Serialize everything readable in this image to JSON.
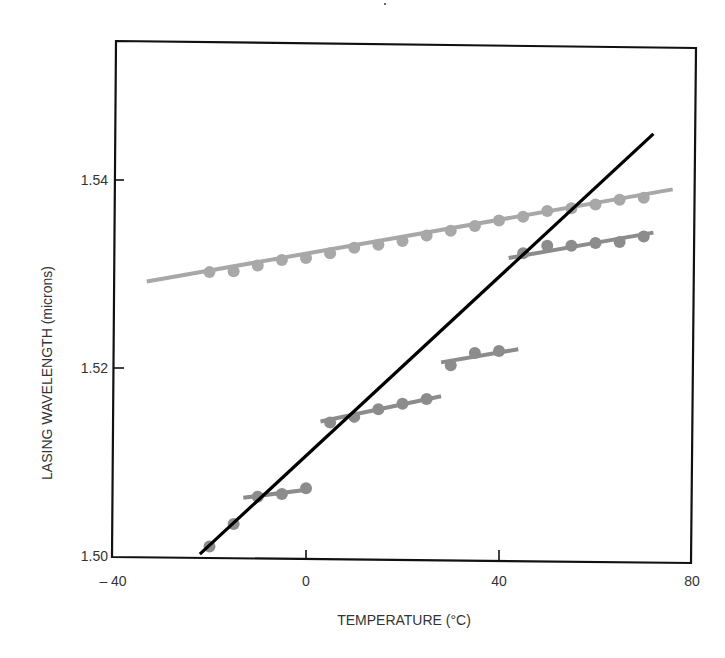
{
  "chart_data": {
    "type": "line",
    "title": "",
    "xlabel": "TEMPERATURE (°C)",
    "ylabel": "LASING WAVELENGTH (microns)",
    "xlim": [
      -40,
      80
    ],
    "ylim": [
      1.5,
      1.556
    ],
    "x_ticks": [
      -40,
      0,
      40,
      80
    ],
    "x_tick_labels": [
      "– 40",
      "0",
      "40",
      "80"
    ],
    "y_ticks": [
      1.5,
      1.52,
      1.54
    ],
    "y_tick_labels": [
      "1.50",
      "1.52",
      "1.54"
    ],
    "grid": false,
    "legend": null,
    "series": [
      {
        "name": "upper-tuning-line",
        "style": "light-gray line with markers",
        "color": "#a8a8a8",
        "fit_line": {
          "x": [
            -33,
            76
          ],
          "y": [
            1.5292,
            1.539
          ]
        },
        "points": {
          "x": [
            -20,
            -15,
            -10,
            -5,
            0,
            5,
            10,
            15,
            20,
            25,
            30,
            35,
            40,
            45,
            50,
            55,
            60,
            65,
            70
          ],
          "y": [
            1.5302,
            1.5303,
            1.5309,
            1.5315,
            1.5317,
            1.5322,
            1.5328,
            1.5331,
            1.5335,
            1.5341,
            1.5346,
            1.5351,
            1.5357,
            1.5361,
            1.5367,
            1.537,
            1.5374,
            1.5379,
            1.5381
          ]
        }
      },
      {
        "name": "mode-hop-segment-1",
        "style": "dark-gray markers",
        "color": "#8c8c8c",
        "fit_line": null,
        "points": {
          "x": [
            -20,
            -15
          ],
          "y": [
            1.501,
            1.5034
          ]
        }
      },
      {
        "name": "mode-hop-segment-2",
        "style": "dark-gray line with markers",
        "color": "#8c8c8c",
        "fit_line": {
          "x": [
            -13,
            1
          ],
          "y": [
            1.5062,
            1.5071
          ]
        },
        "points": {
          "x": [
            -10,
            -5,
            0
          ],
          "y": [
            1.5063,
            1.5066,
            1.5072
          ]
        }
      },
      {
        "name": "mode-hop-segment-3",
        "style": "dark-gray line with markers",
        "color": "#8c8c8c",
        "fit_line": {
          "x": [
            3,
            28
          ],
          "y": [
            1.5143,
            1.517
          ]
        },
        "points": {
          "x": [
            5,
            10,
            15,
            20,
            25
          ],
          "y": [
            1.5142,
            1.5148,
            1.5156,
            1.5162,
            1.5167
          ]
        }
      },
      {
        "name": "mode-hop-segment-4",
        "style": "dark-gray line with markers",
        "color": "#8c8c8c",
        "fit_line": {
          "x": [
            28,
            44
          ],
          "y": [
            1.5206,
            1.522
          ]
        },
        "points": {
          "x": [
            30,
            35,
            40
          ],
          "y": [
            1.5203,
            1.5216,
            1.5218
          ]
        }
      },
      {
        "name": "mode-hop-segment-5",
        "style": "dark-gray line with markers",
        "color": "#8c8c8c",
        "fit_line": {
          "x": [
            42,
            72
          ],
          "y": [
            1.5317,
            1.5344
          ]
        },
        "points": {
          "x": [
            45,
            50,
            55,
            60,
            65,
            70
          ],
          "y": [
            1.5322,
            1.533,
            1.533,
            1.5333,
            1.5334,
            1.534
          ]
        }
      },
      {
        "name": "gain-peak-line",
        "style": "solid black line",
        "color": "#000000",
        "fit_line": {
          "x": [
            -22,
            72
          ],
          "y": [
            1.5002,
            1.5449
          ]
        },
        "points": null
      }
    ]
  },
  "colors": {
    "frame": "#111111",
    "light_series": "#a8a8a8",
    "dark_series": "#8c8c8c",
    "main_line": "#000000",
    "text": "#333333"
  }
}
